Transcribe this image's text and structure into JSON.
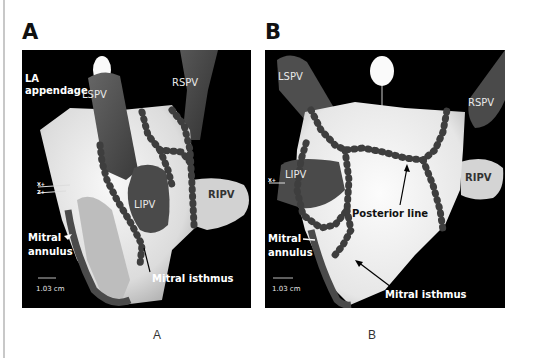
{
  "figure": {
    "panels": [
      {
        "letter": "A",
        "caption": "A",
        "labels": {
          "la_appendage_1": "LA",
          "la_appendage_2": "appendage",
          "lspv": "LSPV",
          "rspv": "RSPV",
          "lipv": "LIPV",
          "ripv": "RIPV",
          "mitral_annulus_1": "Mitral",
          "mitral_annulus_2": "annulus",
          "mitral_isthmus": "Mitral isthmus",
          "scale": "1.03 cm",
          "axis_x": "X+",
          "axis_z": "Z+"
        }
      },
      {
        "letter": "B",
        "caption": "B",
        "labels": {
          "lspv": "LSPV",
          "rspv": "RSPV",
          "lipv": "LIPV",
          "ripv": "RIPV",
          "posterior_line": "Posterior line",
          "mitral_annulus_1": "Mitral",
          "mitral_annulus_2": "annulus",
          "mitral_isthmus": "Mitral isthmus",
          "scale": "1.03 cm",
          "axis_x": "X+"
        }
      }
    ],
    "colors": {
      "background": "#000000",
      "atrium": "#e6e6e6",
      "vein": "#4a4a4a",
      "lesion": "#3c3c3c",
      "label": "#ffffff"
    }
  }
}
